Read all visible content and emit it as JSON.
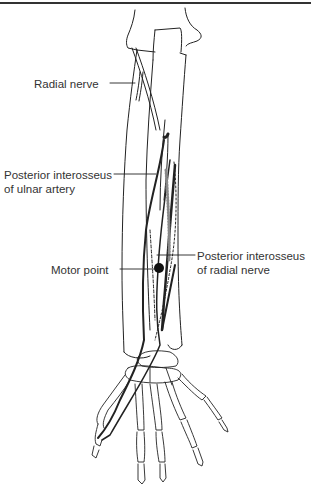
{
  "figure": {
    "labels": {
      "radial_nerve": "Radial nerve",
      "post_int_ulnar_line1": "Posterior interosseus",
      "post_int_ulnar_line2": "of ulnar artery",
      "motor_point": "Motor point",
      "post_int_radial_line1": "Posterior interosseus",
      "post_int_radial_line2": "of radial nerve"
    },
    "colors": {
      "line": "#222222",
      "rule": "#333333",
      "background": "#ffffff"
    }
  }
}
